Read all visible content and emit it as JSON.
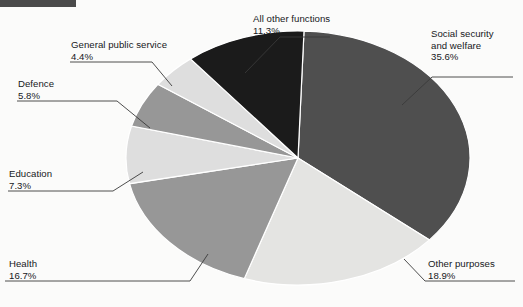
{
  "page": {
    "background_color": "#fbfbfa",
    "top_bar_color": "#4a4a4a"
  },
  "chart_data": {
    "type": "pie",
    "title": "",
    "subtitle": "",
    "xlabel": "",
    "ylabel": "",
    "legend_position": "callout-labels",
    "grid": false,
    "units": "percent",
    "total": 100.0,
    "categories": [
      "Social security and welfare",
      "Other purposes",
      "Health",
      "Education",
      "Defence",
      "General public service",
      "All other functions"
    ],
    "values": [
      35.6,
      18.9,
      16.7,
      7.3,
      5.8,
      4.4,
      11.3
    ],
    "slices": [
      {
        "label": "Social security and welfare",
        "label_line1": "Social security",
        "label_line2": "and welfare",
        "value": 35.6,
        "value_text": "35.6%",
        "color": "#4f4f4f"
      },
      {
        "label": "Other purposes",
        "label_line1": "Other purposes",
        "label_line2": "",
        "value": 18.9,
        "value_text": "18.9%",
        "color": "#e4e4e2"
      },
      {
        "label": "Health",
        "label_line1": "Health",
        "label_line2": "",
        "value": 16.7,
        "value_text": "16.7%",
        "color": "#979797"
      },
      {
        "label": "Education",
        "label_line1": "Education",
        "label_line2": "",
        "value": 7.3,
        "value_text": "7.3%",
        "color": "#dedede"
      },
      {
        "label": "Defence",
        "label_line1": "Defence",
        "label_line2": "",
        "value": 5.8,
        "value_text": "5.8%",
        "color": "#979797"
      },
      {
        "label": "General public service",
        "label_line1": "General public service",
        "label_line2": "",
        "value": 4.4,
        "value_text": "4.4%",
        "color": "#dedede"
      },
      {
        "label": "All other functions",
        "label_line1": "All other functions",
        "label_line2": "",
        "value": 11.3,
        "value_text": "11.3%",
        "color": "#1b1b1b"
      }
    ]
  }
}
